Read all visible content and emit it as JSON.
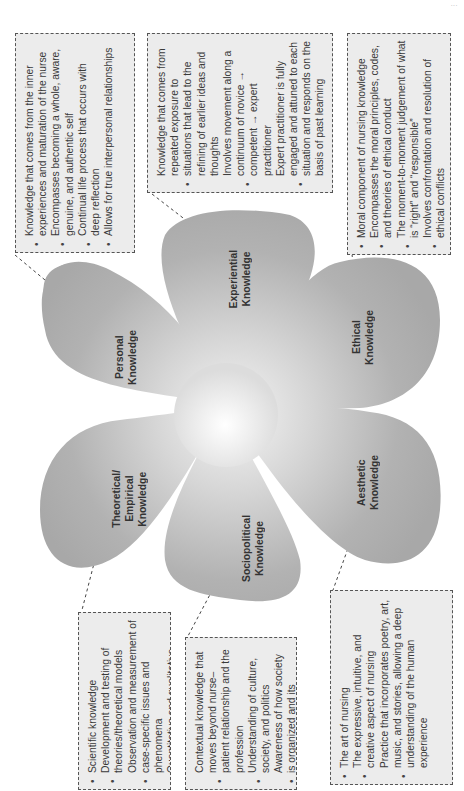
{
  "header": {
    "text": "..."
  },
  "diagram": {
    "center_color": "#f2f2f2",
    "petal_color": "#b0b0b0",
    "box_background": "#ececec",
    "petals": [
      {
        "id": "personal",
        "label": "Personal\nKnowledge"
      },
      {
        "id": "experiential",
        "label": "Experiential\nKnowledge"
      },
      {
        "id": "ethical",
        "label": "Ethical\nKnowledge"
      },
      {
        "id": "aesthetic",
        "label": "Aesthetic\nKnowledge"
      },
      {
        "id": "sociopolitical",
        "label": "Sociopolitical\nKnowledge"
      },
      {
        "id": "theoretical",
        "label": "Theoretical/\nEmpirical\nKnowledge"
      }
    ],
    "boxes": {
      "personal": [
        "Knowledge that comes from the inner experiences and maturation of the nurse",
        "Encompasses becoming a whole, aware, genuine, and authentic self",
        "Continual life process that occurs with deep reflection",
        "Allows for true interpersonal relationships"
      ],
      "experiential": [
        "Knowledge that comes from repeated exposure to situations that lead to the refining of earlier ideas and thoughts",
        "Involves movement along a continuum of novice → competent → expert practitioner",
        "Expert practitioner is fully engaged and attuned to each situation and responds on the basis of past learning"
      ],
      "ethical": [
        "Moral component of nursing knowledge",
        "Encompasses the moral principles, codes, and theories of ethical conduct",
        "The moment-to-moment judgement of what is “right” and “responsible”",
        "Involves confrontation and resolution of ethical conflicts"
      ],
      "theoretical": [
        "Scientific knowledge",
        "Development and testing of theories/theoretical models",
        "Observation and measurement of case-specific issues and phenomena",
        "Quantitative and qualitative research"
      ],
      "sociopolitical": [
        "Contextual knowledge that moves beyond nurse–patient relationship and the profession",
        "Understanding of culture, society, and politics",
        "Awareness of how society is organized and its implications for health"
      ],
      "aesthetic": [
        "The art of nursing",
        "The expressive, intuitive, and creative aspect of nursing",
        "Practice that incorporates poetry, art, music, and stories, allowing a deep understanding of the human experience"
      ]
    }
  }
}
